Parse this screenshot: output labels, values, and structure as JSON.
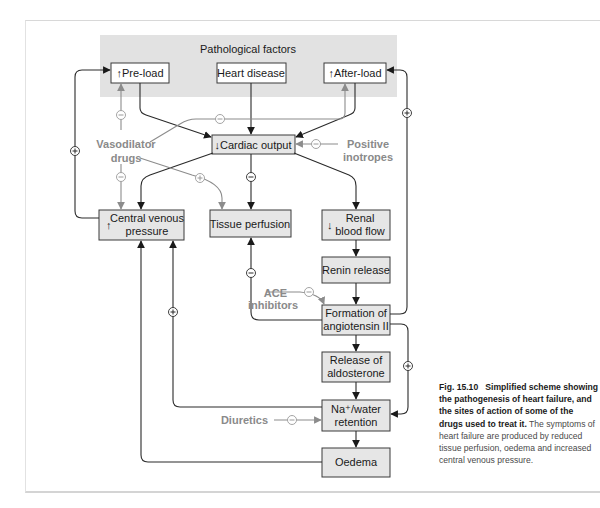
{
  "figure": {
    "group_label": "Pathological factors",
    "nodes": {
      "preload": "↑Pre-load",
      "heart_disease": "Heart disease",
      "afterload": "↑After-load",
      "cardiac_output": "↓Cardiac output",
      "cvp_arrow": "↑",
      "cvp_line1": "Central venous",
      "cvp_line2": "pressure",
      "tissue_perfusion": "Tissue perfusion",
      "renal_arrow": "↓",
      "renal_line1": "Renal",
      "renal_line2": "blood flow",
      "renin_release": "Renin release",
      "angiotensin_line1": "Formation of",
      "angiotensin_line2": "angiotensin II",
      "aldosterone_line1": "Release of",
      "aldosterone_line2": "aldosterone",
      "na_water_line1": "Na⁺/water",
      "na_water_line2": "retention",
      "oedema": "Oedema"
    },
    "drugs": {
      "vasodilator_line1": "Vasodilator",
      "vasodilator_line2": "drugs",
      "positive_line1": "Positive",
      "positive_line2": "inotropes",
      "ace_line1": "ACE",
      "ace_line2": "inhibitors",
      "diuretics": "Diuretics"
    },
    "signs": {
      "plus": "+",
      "minus": "−"
    },
    "edges": [
      {
        "from": "Pre-load",
        "to": "Cardiac output",
        "sign": null
      },
      {
        "from": "Heart disease",
        "to": "Cardiac output",
        "sign": null
      },
      {
        "from": "After-load",
        "to": "Cardiac output",
        "sign": null
      },
      {
        "from": "Cardiac output",
        "to": "Central venous pressure",
        "sign": null
      },
      {
        "from": "Cardiac output",
        "to": "Tissue perfusion",
        "sign": "−"
      },
      {
        "from": "Cardiac output",
        "to": "Renal blood flow",
        "sign": null
      },
      {
        "from": "Central venous pressure",
        "to": "Pre-load",
        "sign": "+"
      },
      {
        "from": "Renal blood flow",
        "to": "Renin release",
        "sign": null
      },
      {
        "from": "Renin release",
        "to": "Formation of angiotensin II",
        "sign": null
      },
      {
        "from": "Formation of angiotensin II",
        "to": "After-load",
        "sign": "+"
      },
      {
        "from": "Formation of angiotensin II",
        "to": "Tissue perfusion",
        "sign": "−"
      },
      {
        "from": "Formation of angiotensin II",
        "to": "Release of aldosterone",
        "sign": null
      },
      {
        "from": "Formation of angiotensin II",
        "to": "Na+/water retention",
        "sign": "+"
      },
      {
        "from": "Release of aldosterone",
        "to": "Na+/water retention",
        "sign": null
      },
      {
        "from": "Na+/water retention",
        "to": "Central venous pressure",
        "sign": "+"
      },
      {
        "from": "Na+/water retention",
        "to": "Oedema",
        "sign": null
      },
      {
        "from": "Oedema",
        "to": "Central venous pressure",
        "sign": null
      },
      {
        "from": "Vasodilator drugs",
        "to": "Pre-load",
        "sign": "−"
      },
      {
        "from": "Vasodilator drugs",
        "to": "After-load",
        "sign": "−"
      },
      {
        "from": "Vasodilator drugs",
        "to": "Central venous pressure",
        "sign": "−"
      },
      {
        "from": "Vasodilator drugs",
        "to": "Tissue perfusion",
        "sign": "+"
      },
      {
        "from": "Positive inotropes",
        "to": "Cardiac output",
        "sign": "−"
      },
      {
        "from": "ACE inhibitors",
        "to": "Formation of angiotensin II",
        "sign": "−"
      },
      {
        "from": "Diuretics",
        "to": "Na+/water retention",
        "sign": "−"
      }
    ]
  },
  "caption": {
    "label": "Fig. 15.10",
    "title": "Simplified scheme showing the pathogenesis of heart failure, and the sites of action of some of the drugs used to treat it.",
    "body": "The symptoms of heart failure are produced by reduced tissue perfusion, oedema and increased central venous pressure."
  },
  "colors": {
    "box_fill": "#e6e6e6",
    "group_fill": "#e2e2e2",
    "dark_line": "#2a2a2a",
    "drug_gray": "#8c8c8c"
  }
}
